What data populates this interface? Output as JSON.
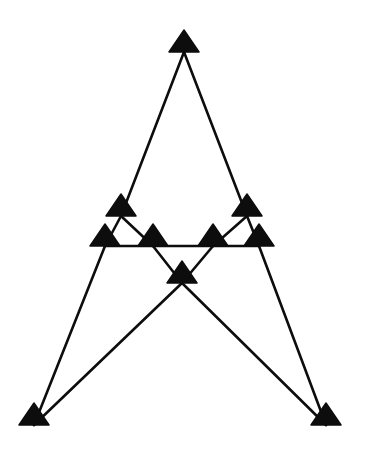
{
  "canvas": {
    "width": 365,
    "height": 455,
    "background_color": "#ffffff",
    "title": "Triangle Node Graph"
  },
  "style": {
    "node_color": "#0d0d0d",
    "edge_color": "#0d0d0d",
    "edge_width": 2.6,
    "node_shape": "triangle",
    "node_half_width": 15,
    "node_height": 22,
    "node_small_half_width": 13,
    "node_small_height": 19
  },
  "chart_data": {
    "type": "scatter",
    "title": "",
    "xlabel": "",
    "ylabel": "",
    "xlim": [
      0,
      365
    ],
    "ylim": [
      455,
      0
    ],
    "grid": false,
    "legend": "none",
    "nodes": [
      {
        "id": "apex",
        "label": "apex",
        "x": 184,
        "y": 52,
        "size": "large"
      },
      {
        "id": "upper-left",
        "label": "upper left",
        "x": 121,
        "y": 216,
        "size": "large"
      },
      {
        "id": "upper-right",
        "label": "upper right",
        "x": 247,
        "y": 216,
        "size": "large"
      },
      {
        "id": "row-left-1",
        "label": "row left outer",
        "x": 105,
        "y": 246,
        "size": "large"
      },
      {
        "id": "row-left-2",
        "label": "row left inner",
        "x": 153,
        "y": 246,
        "size": "large"
      },
      {
        "id": "row-right-1",
        "label": "row right inner",
        "x": 213,
        "y": 246,
        "size": "large"
      },
      {
        "id": "row-right-2",
        "label": "row right outer",
        "x": 259,
        "y": 246,
        "size": "large"
      },
      {
        "id": "center",
        "label": "center",
        "x": 182,
        "y": 283,
        "size": "large"
      },
      {
        "id": "bottom-left",
        "label": "bottom left",
        "x": 34,
        "y": 425,
        "size": "large"
      },
      {
        "id": "bottom-right",
        "label": "bottom right",
        "x": 326,
        "y": 425,
        "size": "large"
      }
    ],
    "edges": [
      {
        "from": "apex",
        "to": "upper-left"
      },
      {
        "from": "apex",
        "to": "upper-right"
      },
      {
        "from": "upper-left",
        "to": "row-left-1"
      },
      {
        "from": "upper-left",
        "to": "row-left-2"
      },
      {
        "from": "upper-right",
        "to": "row-right-1"
      },
      {
        "from": "upper-right",
        "to": "row-right-2"
      },
      {
        "from": "row-left-1",
        "to": "row-left-2"
      },
      {
        "from": "row-left-2",
        "to": "row-right-1"
      },
      {
        "from": "row-right-1",
        "to": "row-right-2"
      },
      {
        "from": "row-left-2",
        "to": "center"
      },
      {
        "from": "row-right-1",
        "to": "center"
      },
      {
        "from": "row-left-1",
        "to": "bottom-left"
      },
      {
        "from": "row-right-2",
        "to": "bottom-right"
      },
      {
        "from": "center",
        "to": "bottom-left"
      },
      {
        "from": "center",
        "to": "bottom-right"
      }
    ],
    "node_count": 10,
    "edge_count": 15
  }
}
